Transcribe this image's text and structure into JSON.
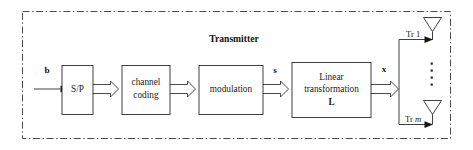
{
  "figure": {
    "kind": "block-diagram",
    "title": "Transmitter",
    "boundary_style": "dash-dot"
  },
  "blocks": [
    {
      "id": "sp",
      "lines": [
        "S/P"
      ],
      "bold_lines": []
    },
    {
      "id": "channel",
      "lines": [
        "channel",
        "coding"
      ],
      "bold_lines": []
    },
    {
      "id": "modulation",
      "lines": [
        "modulation"
      ],
      "bold_lines": []
    },
    {
      "id": "linear",
      "lines": [
        "Linear",
        "transformation",
        "L"
      ],
      "bold_lines": [
        "L"
      ]
    }
  ],
  "signals": {
    "input": "b",
    "after_modulation": "s",
    "after_linear": "x"
  },
  "antennas": [
    {
      "id": "tr1",
      "prefix": "Tr",
      "index": "1",
      "index_italic": false
    },
    {
      "id": "trm",
      "prefix": "Tr",
      "index": "m",
      "index_italic": true
    }
  ],
  "ellipsis": {
    "orientation": "vertical",
    "dots": 4
  },
  "colors": {
    "ink": "#1a1a1a",
    "line": "#2a2a2a",
    "boundary": "#4a4a4a",
    "background": "#ffffff"
  }
}
